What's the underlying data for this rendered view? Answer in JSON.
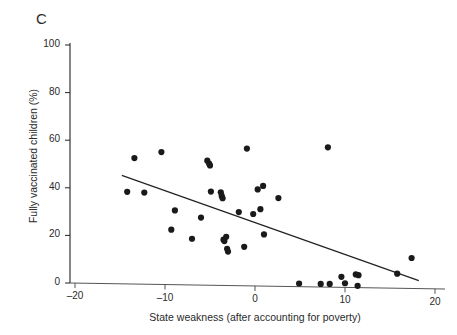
{
  "figure": {
    "panel_label": "C",
    "background_color": "#ffffff",
    "ink_color": "#222222"
  },
  "chart_data": {
    "type": "scatter",
    "title": "C",
    "xlabel": "State weakness (after accounting for poverty)",
    "ylabel": "Fully vaccinated children (%)",
    "xlim": [
      -20,
      20
    ],
    "ylim": [
      0,
      100
    ],
    "xticks": [
      -20,
      -10,
      0,
      10,
      20
    ],
    "xtick_labels": [
      "–20",
      "–10",
      "0",
      "10",
      "20"
    ],
    "yticks": [
      0,
      20,
      40,
      60,
      80,
      100
    ],
    "ytick_labels": [
      "0",
      "20",
      "40",
      "60",
      "80",
      "100"
    ],
    "grid": false,
    "legend": null,
    "marker": {
      "shape": "circle",
      "color": "#1a1a1a",
      "size_px": 5
    },
    "points": [
      {
        "x": -14.2,
        "y": 38.3
      },
      {
        "x": -13.4,
        "y": 52.5
      },
      {
        "x": -12.3,
        "y": 38.0
      },
      {
        "x": -10.4,
        "y": 55.0
      },
      {
        "x": -9.3,
        "y": 22.4
      },
      {
        "x": -8.9,
        "y": 30.5
      },
      {
        "x": -7.0,
        "y": 18.6
      },
      {
        "x": -6.0,
        "y": 27.5
      },
      {
        "x": -5.3,
        "y": 51.4
      },
      {
        "x": -5.1,
        "y": 50.2
      },
      {
        "x": -5.0,
        "y": 49.4
      },
      {
        "x": -4.9,
        "y": 38.4
      },
      {
        "x": -3.8,
        "y": 38.1
      },
      {
        "x": -3.7,
        "y": 36.6
      },
      {
        "x": -3.6,
        "y": 35.6
      },
      {
        "x": -3.5,
        "y": 18.2
      },
      {
        "x": -3.4,
        "y": 17.6
      },
      {
        "x": -3.2,
        "y": 19.4
      },
      {
        "x": -3.1,
        "y": 14.4
      },
      {
        "x": -3.0,
        "y": 13.2
      },
      {
        "x": -1.8,
        "y": 29.8
      },
      {
        "x": -1.2,
        "y": 15.2
      },
      {
        "x": -0.9,
        "y": 56.5
      },
      {
        "x": -0.2,
        "y": 29.0
      },
      {
        "x": 0.3,
        "y": 39.3
      },
      {
        "x": 0.6,
        "y": 31.0
      },
      {
        "x": 0.9,
        "y": 40.8
      },
      {
        "x": 1.0,
        "y": 20.4
      },
      {
        "x": 2.6,
        "y": 35.7
      },
      {
        "x": 4.9,
        "y": -0.2
      },
      {
        "x": 7.3,
        "y": -0.4
      },
      {
        "x": 8.1,
        "y": 57.0
      },
      {
        "x": 8.3,
        "y": -0.4
      },
      {
        "x": 9.6,
        "y": 2.6
      },
      {
        "x": 10.0,
        "y": -0.1
      },
      {
        "x": 11.2,
        "y": 3.6
      },
      {
        "x": 11.5,
        "y": 3.3
      },
      {
        "x": 11.4,
        "y": -1.2
      },
      {
        "x": 15.8,
        "y": 3.9
      },
      {
        "x": 17.4,
        "y": 10.5
      }
    ],
    "fit_line": {
      "type": "linear",
      "x_start": -14.8,
      "y_start": 45.2,
      "x_end": 18.2,
      "y_end": 1.0,
      "color": "#222222",
      "width_px": 1.2
    }
  }
}
